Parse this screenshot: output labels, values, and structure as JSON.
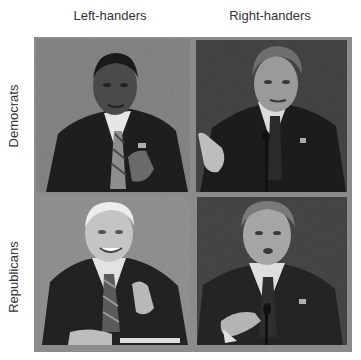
{
  "columns": [
    {
      "label": "Left-handers"
    },
    {
      "label": "Right-handers"
    }
  ],
  "rows": [
    {
      "label": "Democrats"
    },
    {
      "label": "Republicans"
    }
  ],
  "panels": [
    {
      "row": "Democrats",
      "column": "Left-handers",
      "description": "grayscale photo of man in dark suit and striped tie at debate, gray background, hand raised",
      "background": "#7c7c7c"
    },
    {
      "row": "Democrats",
      "column": "Right-handers",
      "description": "grayscale photo of gray-haired man in dark suit gesturing with right hand, microphone, dark background",
      "background": "#3b3b3b"
    },
    {
      "row": "Republicans",
      "column": "Left-handers",
      "description": "grayscale photo of white-haired man in dark suit and striped tie smiling, gesturing, gray background",
      "background": "#8a8a8a"
    },
    {
      "row": "Republicans",
      "column": "Right-handers",
      "description": "grayscale photo of man in dark suit and tie speaking, hand extended, microphone, dark background",
      "background": "#3d3d3d"
    }
  ],
  "colors": {
    "frame": "#8b8b8b",
    "label_text": "#333333"
  }
}
